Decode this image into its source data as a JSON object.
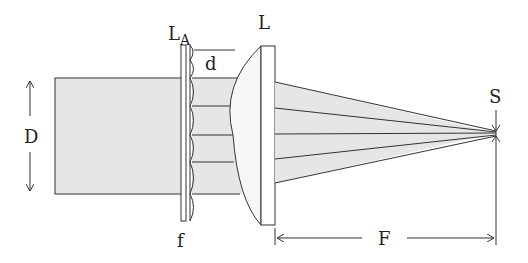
{
  "diagram": {
    "labels": {
      "lenslet_array": "L",
      "lenslet_array_sub": "A",
      "lens": "L",
      "lenslet_pitch": "d",
      "beam_diameter": "D",
      "lenslet_focal": "f",
      "focal_length": "F",
      "spot": "S"
    },
    "colors": {
      "beam_fill": "#e6e6e6",
      "line": "#333333",
      "background": "#ffffff"
    },
    "beamlets": 4
  }
}
